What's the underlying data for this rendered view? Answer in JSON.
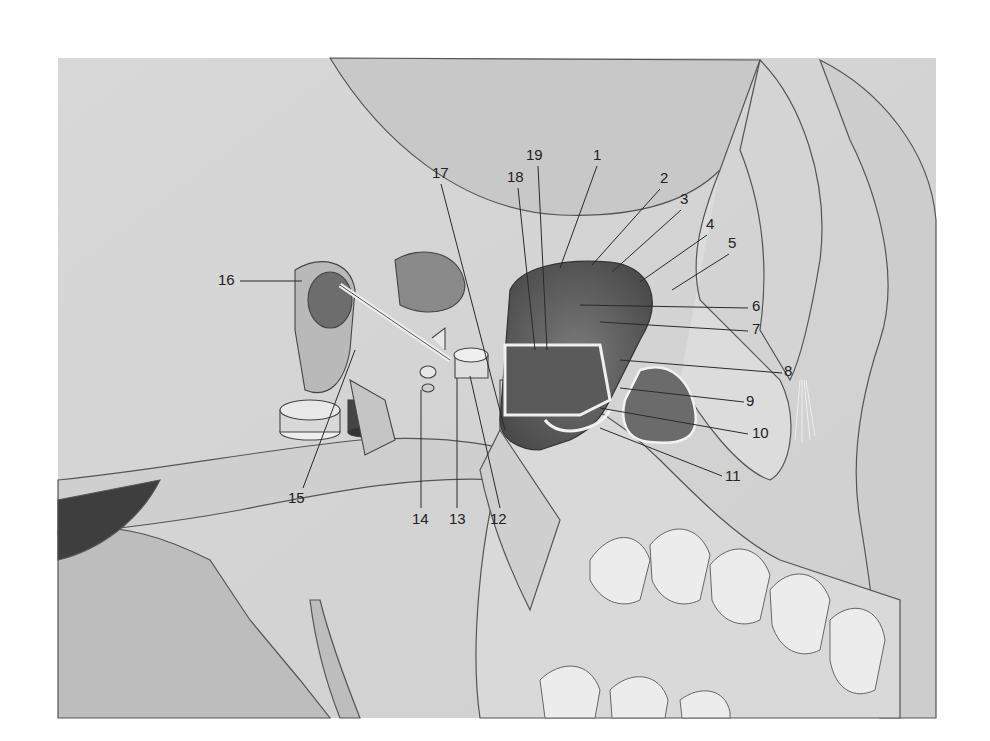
{
  "figure": {
    "background": "#ffffff",
    "panel_color": "#d6d6d6",
    "labels": [
      {
        "id": "1",
        "text": "1",
        "x": 593,
        "y": 160
      },
      {
        "id": "2",
        "text": "2",
        "x": 660,
        "y": 183
      },
      {
        "id": "3",
        "text": "3",
        "x": 680,
        "y": 204
      },
      {
        "id": "4",
        "text": "4",
        "x": 706,
        "y": 229
      },
      {
        "id": "5",
        "text": "5",
        "x": 728,
        "y": 248
      },
      {
        "id": "6",
        "text": "6",
        "x": 752,
        "y": 311
      },
      {
        "id": "7",
        "text": "7",
        "x": 752,
        "y": 334
      },
      {
        "id": "8",
        "text": "8",
        "x": 784,
        "y": 376
      },
      {
        "id": "9",
        "text": "9",
        "x": 746,
        "y": 406
      },
      {
        "id": "10",
        "text": "10",
        "x": 752,
        "y": 438
      },
      {
        "id": "11",
        "text": "11",
        "x": 725,
        "y": 481
      },
      {
        "id": "12",
        "text": "12",
        "x": 495,
        "y": 524
      },
      {
        "id": "13",
        "text": "13",
        "x": 453,
        "y": 524
      },
      {
        "id": "14",
        "text": "14",
        "x": 415,
        "y": 524
      },
      {
        "id": "15",
        "text": "15",
        "x": 295,
        "y": 503
      },
      {
        "id": "16",
        "text": "16",
        "x": 218,
        "y": 285
      },
      {
        "id": "17",
        "text": "17",
        "x": 432,
        "y": 178
      },
      {
        "id": "18",
        "text": "18",
        "x": 511,
        "y": 182
      },
      {
        "id": "19",
        "text": "19",
        "x": 529,
        "y": 160
      }
    ]
  }
}
